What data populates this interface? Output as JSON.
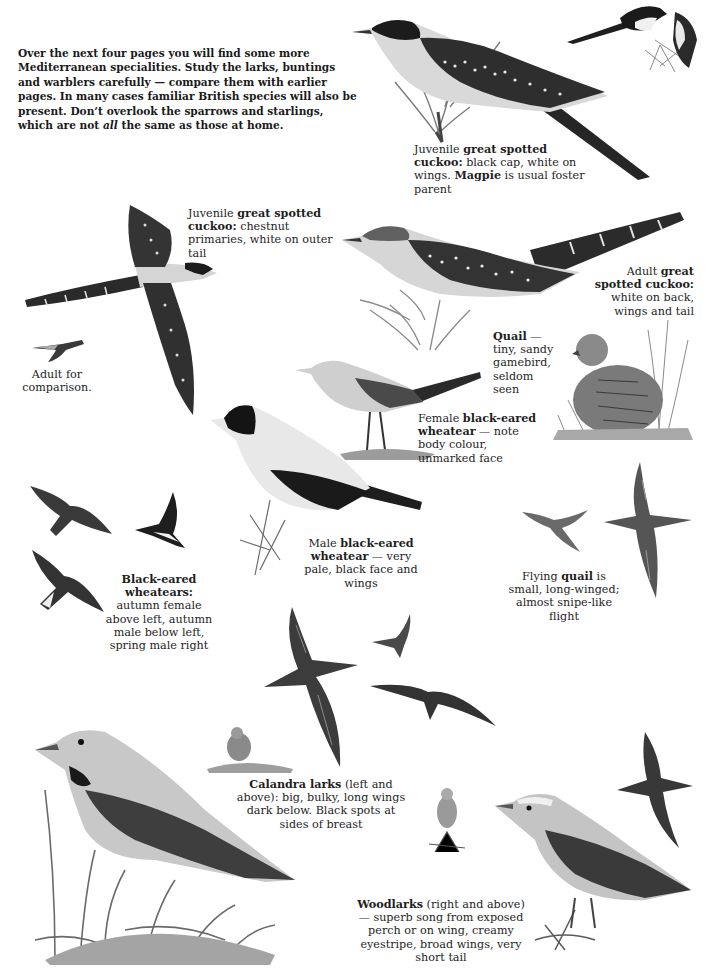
{
  "intro": {
    "text_before_italic": "Over the next four pages you will find some more Mediterranean specialities. Study the larks, buntings and warblers carefully — compare them with earlier pages. In many cases familiar British species will also be present. Don’t overlook the sparrows and starlings, which are not ",
    "italic": "all",
    "text_after_italic": " the same as those at home."
  },
  "captions": {
    "juv_cuckoo_perched": {
      "pre": "Juvenile ",
      "bold1": "great spotted cuckoo:",
      "mid": " black cap, white on wings. ",
      "bold2": "Magpie",
      "post": " is usual foster parent"
    },
    "juv_cuckoo_flying": {
      "pre": "Juvenile ",
      "bold": "great spotted cuckoo:",
      "post": " chestnut primaries, white on outer tail"
    },
    "adult_cuckoo": {
      "pre": "Adult ",
      "bold": "great spotted cuckoo:",
      "post": " white on back, wings and tail"
    },
    "adult_comparison": {
      "text": "Adult for comparison."
    },
    "quail": {
      "bold": "Quail",
      "post": " — tiny, sandy gamebird, seldom seen"
    },
    "female_wheatear": {
      "pre": "Female ",
      "bold": "black-eared wheatear",
      "post": " — note body colour, unmarked face"
    },
    "male_wheatear": {
      "pre": "Male ",
      "bold": "black-eared wheatear",
      "post": " — very pale, black face and wings"
    },
    "wheatears_flying": {
      "bold": "Black-eared wheatears:",
      "post": " autumn female above left, autumn male below left, spring male right"
    },
    "flying_quail": {
      "pre": "Flying ",
      "bold": "quail",
      "post": " is small, long-winged; almost snipe-like flight"
    },
    "calandra": {
      "bold": "Calandra larks",
      "post": " (left and above): big, bulky, long wings dark below. Black spots at sides of breast"
    },
    "woodlarks": {
      "bold": "Woodlarks",
      "post": " (right and above) — superb song from exposed perch or on wing, creamy eyestripe, broad wings, very short tail"
    }
  },
  "illustrations": [
    "juvenile-great-spotted-cuckoo-perched",
    "magpie",
    "juvenile-great-spotted-cuckoo-flying",
    "adult-great-spotted-cuckoo-perched",
    "adult-great-spotted-cuckoo-flying-small",
    "quail-standing",
    "female-black-eared-wheatear",
    "male-black-eared-wheatear",
    "black-eared-wheatear-flying-autumn-female",
    "black-eared-wheatear-flying-autumn-male",
    "black-eared-wheatear-flying-spring-male",
    "quail-flying",
    "calandra-lark-flying",
    "calandra-lark-standing-large",
    "calandra-lark-small",
    "woodlark-flying",
    "woodlark-perched-small",
    "woodlark-standing-large"
  ],
  "colors": {
    "ink": "#1a1a1a",
    "dark": "#2b2b2b",
    "mid": "#6e6e6e",
    "light": "#b5b5b5",
    "paper": "#ffffff"
  }
}
